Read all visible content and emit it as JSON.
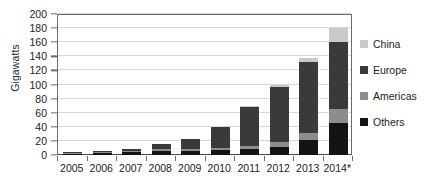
{
  "chart_data": {
    "type": "bar",
    "stacked": true,
    "title": "",
    "xlabel": "",
    "ylabel": "Gigawatts",
    "ylim": [
      0,
      200
    ],
    "yticks": [
      0,
      20,
      40,
      60,
      80,
      100,
      120,
      140,
      160,
      180,
      200
    ],
    "ytick_labels": [
      "0",
      "20",
      "40",
      "60",
      "80",
      "100",
      "120",
      "140",
      "160",
      "180",
      "200"
    ],
    "grid": true,
    "legend_position": "right",
    "categories": [
      "2005",
      "2006",
      "2007",
      "2008",
      "2009",
      "2010",
      "2011",
      "2012",
      "2013",
      "2014*"
    ],
    "series": [
      {
        "name": "Others",
        "color": "#141414",
        "values": [
          2,
          3,
          4,
          6,
          6,
          7,
          8,
          11,
          22,
          46
        ]
      },
      {
        "name": "Americas",
        "color": "#8d8d8d",
        "values": [
          1,
          1,
          2,
          3,
          3,
          3,
          5,
          7,
          9,
          19
        ]
      },
      {
        "name": "Europe",
        "color": "#3a3a3a",
        "values": [
          1,
          2,
          3,
          7,
          14,
          30,
          55,
          78,
          101,
          96
        ]
      },
      {
        "name": "China",
        "color": "#c9c9c9",
        "values": [
          0,
          0,
          0,
          0,
          0,
          0,
          2,
          4,
          6,
          19
        ]
      }
    ],
    "totals": [
      4,
      6,
      9,
      16,
      23,
      40,
      70,
      100,
      138,
      180
    ]
  },
  "legend": {
    "items": [
      {
        "label": "China",
        "color": "#c9c9c9"
      },
      {
        "label": "Europe",
        "color": "#3a3a3a"
      },
      {
        "label": "Americas",
        "color": "#8d8d8d"
      },
      {
        "label": "Others",
        "color": "#141414"
      }
    ]
  },
  "colors": {
    "axis": "#6a6a6a",
    "grid": "#d9d9d9",
    "text": "#1d1d1d",
    "background": "#ffffff"
  }
}
